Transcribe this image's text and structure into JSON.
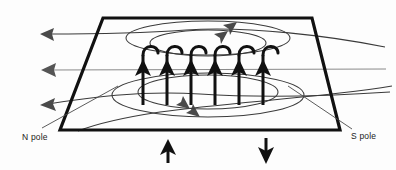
{
  "diagram": {
    "background_color": "#fdfdfd",
    "line_color": "#3a3a3a",
    "bold_color": "#111111",
    "labels": {
      "n_pole": "N pole",
      "s_pole": "S pole"
    },
    "plane": {
      "name": "conducting-plane",
      "shape": "trapezoid",
      "corners": [
        [
          103,
          18
        ],
        [
          312,
          18
        ],
        [
          340,
          130
        ],
        [
          60,
          130
        ]
      ],
      "stroke_width": 3.2
    },
    "current_arrows": {
      "count": 6,
      "direction": "up",
      "x_positions": [
        143,
        167,
        191,
        215,
        239,
        263
      ],
      "stem_top": 48,
      "stem_bottom": 105,
      "arrowhead_y": 70,
      "hook_note": "each stem terminates in a hook curving to the right"
    },
    "field_ellipses_top": [
      {
        "cx": 208,
        "cy": 38,
        "rx": 82,
        "ry": 17,
        "arrow_at": "top-right"
      },
      {
        "cx": 208,
        "cy": 43,
        "rx": 58,
        "ry": 13,
        "arrow_at": "top-right"
      }
    ],
    "field_ellipses_bottom": [
      {
        "cx": 208,
        "cy": 95,
        "rx": 96,
        "ry": 22,
        "arrow_at": "bottom-right"
      },
      {
        "cx": 208,
        "cy": 92,
        "rx": 70,
        "ry": 17,
        "arrow_at": "bottom-right"
      }
    ],
    "side_field_lines": [
      {
        "name": "upper-left-field-line",
        "arrow": "left",
        "tip_x": 40,
        "tip_y": 34
      },
      {
        "name": "middle-left-field-line",
        "arrow": "left",
        "tip_x": 41,
        "tip_y": 70
      },
      {
        "name": "lower-left-field-line",
        "arrow": "left",
        "tip_x": 40,
        "tip_y": 104
      }
    ],
    "below_plane_arrows": [
      {
        "name": "n-pole-flux-arrow",
        "x": 168,
        "direction": "up",
        "y_top": 141,
        "y_bottom": 163
      },
      {
        "name": "s-pole-flux-arrow",
        "x": 266,
        "direction": "down",
        "y_top": 141,
        "y_bottom": 163
      }
    ]
  }
}
